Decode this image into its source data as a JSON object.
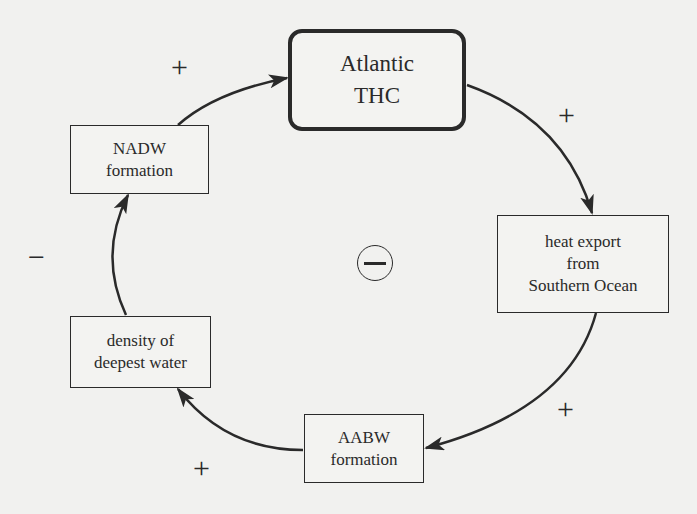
{
  "diagram": {
    "type": "causal-loop",
    "nodes": [
      {
        "id": "thc",
        "lines": [
          "Atlantic",
          "THC"
        ]
      },
      {
        "id": "heat",
        "lines": [
          "heat export",
          "from",
          "Southern Ocean"
        ]
      },
      {
        "id": "aabw",
        "lines": [
          "AABW",
          "formation"
        ]
      },
      {
        "id": "density",
        "lines": [
          "density of",
          "deepest water"
        ]
      },
      {
        "id": "nadw",
        "lines": [
          "NADW",
          "formation"
        ]
      }
    ],
    "links": [
      {
        "from": "thc",
        "to": "heat",
        "polarity": "+"
      },
      {
        "from": "heat",
        "to": "aabw",
        "polarity": "+"
      },
      {
        "from": "aabw",
        "to": "density",
        "polarity": "+"
      },
      {
        "from": "density",
        "to": "nadw",
        "polarity": "−"
      },
      {
        "from": "nadw",
        "to": "thc",
        "polarity": "+"
      }
    ],
    "loop_polarity": "−"
  }
}
